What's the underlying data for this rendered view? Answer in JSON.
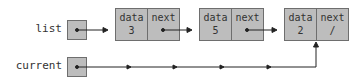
{
  "pointers": [
    {
      "label": "list"
    },
    {
      "label": "current"
    }
  ],
  "nodes": [
    {
      "field1": "data",
      "field2": "next",
      "value": "3",
      "next": ""
    },
    {
      "field1": "data",
      "field2": "next",
      "value": "5",
      "next": ""
    },
    {
      "field1": "data",
      "field2": "next",
      "value": "2",
      "next": "/"
    }
  ],
  "colors": {
    "box_fill": "#bdbdbd",
    "box_border": "#6e6e6e",
    "line": "#222222"
  }
}
